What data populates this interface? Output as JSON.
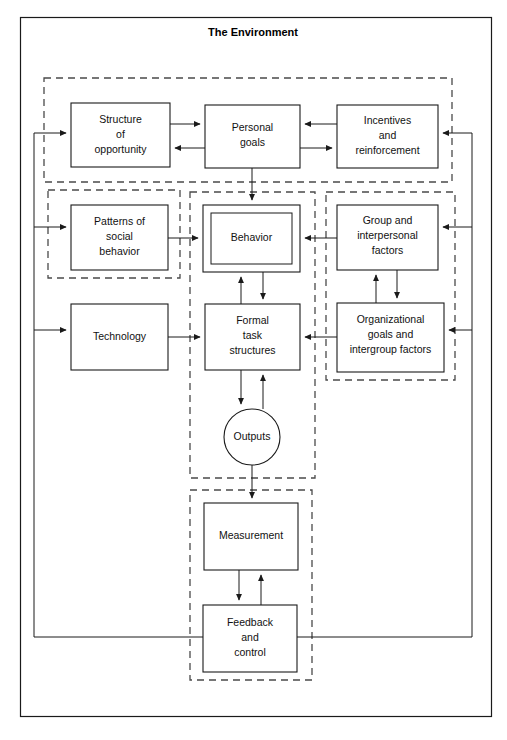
{
  "diagram": {
    "title": "The Environment",
    "title_position": {
      "x": 253,
      "y": 33
    },
    "outer_frame": {
      "x": 20,
      "y": 17,
      "width": 472,
      "height": 700
    },
    "colors": {
      "stroke": "#1a1a1a",
      "dashed_stroke": "#4a4a4a",
      "background": "#ffffff",
      "text": "#111111"
    },
    "groups": [
      {
        "name": "top-goals-group",
        "x": 44,
        "y": 78,
        "width": 408,
        "height": 104
      },
      {
        "name": "social-behavior-group",
        "x": 48,
        "y": 190,
        "width": 132,
        "height": 88
      },
      {
        "name": "core-process-group",
        "x": 190,
        "y": 192,
        "width": 125,
        "height": 286
      },
      {
        "name": "organizational-group",
        "x": 326,
        "y": 192,
        "width": 129,
        "height": 188
      },
      {
        "name": "control-group",
        "x": 190,
        "y": 490,
        "width": 122,
        "height": 190
      }
    ],
    "nodes": [
      {
        "id": "structure-of-opportunity",
        "label": "Structure\nof\nopportunity",
        "shape": "rect",
        "x": 71,
        "y": 103,
        "width": 99,
        "height": 64,
        "double": false
      },
      {
        "id": "personal-goals",
        "label": "Personal\ngoals",
        "shape": "rect",
        "x": 205,
        "y": 105,
        "width": 95,
        "height": 63,
        "double": false
      },
      {
        "id": "incentives-and-reinforcement",
        "label": "Incentives\nand\nreinforcement",
        "shape": "rect",
        "x": 337,
        "y": 105,
        "width": 101,
        "height": 63,
        "double": false
      },
      {
        "id": "patterns-of-social-behavior",
        "label": "Patterns of\nsocial\nbehavior",
        "shape": "rect",
        "x": 71,
        "y": 205,
        "width": 97,
        "height": 65,
        "double": false
      },
      {
        "id": "behavior",
        "label": "Behavior",
        "shape": "rect",
        "x": 203,
        "y": 205,
        "width": 97,
        "height": 67,
        "double": true
      },
      {
        "id": "group-and-interpersonal-factors",
        "label": "Group and\ninterpersonal\nfactors",
        "shape": "rect",
        "x": 337,
        "y": 205,
        "width": 101,
        "height": 65,
        "double": false
      },
      {
        "id": "technology",
        "label": "Technology",
        "shape": "rect",
        "x": 71,
        "y": 304,
        "width": 97,
        "height": 66,
        "double": false
      },
      {
        "id": "formal-task-structures",
        "label": "Formal\ntask\nstructures",
        "shape": "rect",
        "x": 205,
        "y": 304,
        "width": 95,
        "height": 66,
        "double": false
      },
      {
        "id": "organizational-goals-and-intergroup-factors",
        "label": "Organizational\ngoals and\nintergroup factors",
        "shape": "rect",
        "x": 337,
        "y": 303,
        "width": 107,
        "height": 69,
        "double": false
      },
      {
        "id": "outputs",
        "label": "Outputs",
        "shape": "circle",
        "cx": 252,
        "cy": 437,
        "r": 28
      },
      {
        "id": "measurement",
        "label": "Measurement",
        "shape": "rect",
        "x": 204,
        "y": 503,
        "width": 94,
        "height": 67,
        "double": false
      },
      {
        "id": "feedback-and-control",
        "label": "Feedback\nand\ncontrol",
        "shape": "rect",
        "x": 203,
        "y": 605,
        "width": 94,
        "height": 67,
        "double": false
      }
    ],
    "connections": [
      {
        "name": "structure-to-personal-goals",
        "from": "structure-of-opportunity",
        "to": "personal-goals"
      },
      {
        "name": "personal-goals-to-structure",
        "from": "personal-goals",
        "to": "structure-of-opportunity"
      },
      {
        "name": "incentives-to-personal-goals",
        "from": "incentives-and-reinforcement",
        "to": "personal-goals"
      },
      {
        "name": "personal-goals-to-incentives",
        "from": "personal-goals",
        "to": "incentives-and-reinforcement"
      },
      {
        "name": "personal-goals-to-behavior",
        "from": "personal-goals",
        "to": "behavior"
      },
      {
        "name": "patterns-to-behavior",
        "from": "patterns-of-social-behavior",
        "to": "behavior"
      },
      {
        "name": "group-factors-to-behavior",
        "from": "group-and-interpersonal-factors",
        "to": "behavior"
      },
      {
        "name": "behavior-to-formal-task",
        "from": "behavior",
        "to": "formal-task-structures"
      },
      {
        "name": "formal-task-to-behavior",
        "from": "formal-task-structures",
        "to": "behavior"
      },
      {
        "name": "group-factors-to-organizational-goals",
        "from": "group-and-interpersonal-factors",
        "to": "organizational-goals-and-intergroup-factors"
      },
      {
        "name": "organizational-goals-to-group-factors",
        "from": "organizational-goals-and-intergroup-factors",
        "to": "group-and-interpersonal-factors"
      },
      {
        "name": "technology-to-formal-task",
        "from": "technology",
        "to": "formal-task-structures"
      },
      {
        "name": "organizational-goals-to-formal-task",
        "from": "organizational-goals-and-intergroup-factors",
        "to": "formal-task-structures"
      },
      {
        "name": "formal-task-to-outputs",
        "from": "formal-task-structures",
        "to": "outputs"
      },
      {
        "name": "outputs-to-formal-task",
        "from": "outputs",
        "to": "formal-task-structures"
      },
      {
        "name": "outputs-to-measurement",
        "from": "outputs",
        "to": "measurement"
      },
      {
        "name": "measurement-to-feedback",
        "from": "measurement",
        "to": "feedback-and-control"
      },
      {
        "name": "feedback-to-measurement",
        "from": "feedback-and-control",
        "to": "measurement"
      },
      {
        "name": "feedback-loop-left",
        "from": "feedback-and-control",
        "to": "structure-of-opportunity, patterns-of-social-behavior, technology"
      },
      {
        "name": "feedback-loop-right",
        "from": "feedback-and-control",
        "to": "incentives-and-reinforcement, group-and-interpersonal-factors, organizational-goals-and-intergroup-factors"
      }
    ]
  }
}
